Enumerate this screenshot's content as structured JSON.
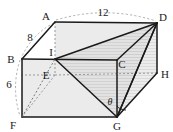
{
  "figure": {
    "kind": "geometry-diagram",
    "shape": "rectangular-prism-with-inscribed-triangle",
    "background_color": "#ffffff",
    "stroke_color": "#1a1a1a",
    "hidden_edge_color": "#8a8a8a",
    "shade_light": "#e3e3e3",
    "shade_hatch": "#cfcfcf"
  },
  "vertices": [
    {
      "id": "A",
      "label": "A",
      "x": 55,
      "y": 22,
      "lx": 48,
      "ly": 19,
      "hidden": false
    },
    {
      "id": "B",
      "label": "B",
      "x": 22,
      "y": 59,
      "lx": 11,
      "ly": 62,
      "hidden": false
    },
    {
      "id": "C",
      "label": "C",
      "x": 117,
      "y": 60,
      "lx": 120,
      "ly": 65,
      "hidden": false
    },
    {
      "id": "D",
      "label": "D",
      "x": 157,
      "y": 23,
      "lx": 159,
      "ly": 20,
      "hidden": false
    },
    {
      "id": "E",
      "label": "E",
      "x": 55,
      "y": 75,
      "lx": 45,
      "ly": 78,
      "hidden": true
    },
    {
      "id": "F",
      "label": "F",
      "x": 22,
      "y": 117,
      "lx": 12,
      "ly": 127,
      "hidden": false
    },
    {
      "id": "G",
      "label": "G",
      "x": 117,
      "y": 117,
      "lx": 114,
      "ly": 129,
      "hidden": false
    },
    {
      "id": "H",
      "label": "H",
      "x": 157,
      "y": 73,
      "lx": 161,
      "ly": 78,
      "hidden": false
    },
    {
      "id": "I",
      "label": "I",
      "x": 55,
      "y": 59,
      "lx": 50,
      "ly": 56,
      "hidden": false
    }
  ],
  "dimensions": [
    {
      "id": "AB",
      "label": "8",
      "lx": 29,
      "ly": 40,
      "from": "A",
      "to": "B"
    },
    {
      "id": "AD",
      "label": "12",
      "lx": 100,
      "ly": 16,
      "from": "A",
      "to": "D"
    },
    {
      "id": "BF",
      "label": "6",
      "lx": 8,
      "ly": 86,
      "from": "B",
      "to": "F"
    }
  ],
  "angle": {
    "id": "theta",
    "label": "θ",
    "lx": 105,
    "ly": 105,
    "at_vertex": "G",
    "between": [
      "G-C",
      "G-D"
    ]
  },
  "solid_edges": [
    {
      "from": "A",
      "to": "B"
    },
    {
      "from": "A",
      "to": "D"
    },
    {
      "from": "B",
      "to": "C"
    },
    {
      "from": "C",
      "to": "D"
    },
    {
      "from": "B",
      "to": "F"
    },
    {
      "from": "C",
      "to": "G"
    },
    {
      "from": "D",
      "to": "H"
    },
    {
      "from": "F",
      "to": "G"
    },
    {
      "from": "G",
      "to": "H"
    }
  ],
  "hidden_edges": [
    {
      "from": "A",
      "to": "I"
    },
    {
      "from": "E",
      "to": "F"
    },
    {
      "from": "E",
      "to": "H"
    },
    {
      "from": "E",
      "to": "I"
    }
  ],
  "construction_edges": [
    {
      "from": "I",
      "to": "D"
    },
    {
      "from": "I",
      "to": "G"
    },
    {
      "from": "D",
      "to": "G"
    },
    {
      "from": "B",
      "to": "G"
    },
    {
      "from": "D",
      "to": "C"
    }
  ],
  "caption": ""
}
